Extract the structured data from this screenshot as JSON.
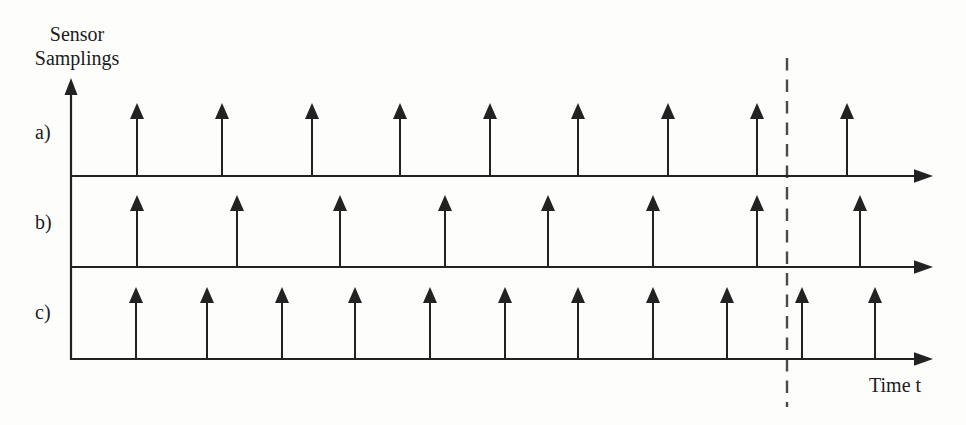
{
  "figure": {
    "labels": {
      "y_axis_line1": "Sensor",
      "y_axis_line2": "Samplings",
      "x_axis": "Time t"
    },
    "colors": {
      "ink": "#222222",
      "dashed_line": "#4a4a4a",
      "background": "#fdfdfc"
    },
    "rows": [
      {
        "label": "a)",
        "baseline_y": 176,
        "arrow_top_y": 103,
        "sample_x": [
          137,
          222,
          312,
          400,
          490,
          578,
          668,
          757,
          847
        ]
      },
      {
        "label": "b)",
        "baseline_y": 267,
        "arrow_top_y": 195,
        "sample_x": [
          137,
          237,
          340,
          445,
          548,
          653,
          757,
          860
        ]
      },
      {
        "label": "c)",
        "baseline_y": 359,
        "arrow_top_y": 287,
        "sample_x": [
          136,
          207,
          282,
          355,
          430,
          505,
          578,
          653,
          727,
          802,
          875
        ]
      }
    ],
    "axes": {
      "origin_x": 71,
      "y_axis_tip_y": 78,
      "x_axis_tip_x": 933
    },
    "dashed_marker": {
      "x": 787,
      "y1": 58,
      "y2": 407
    }
  }
}
